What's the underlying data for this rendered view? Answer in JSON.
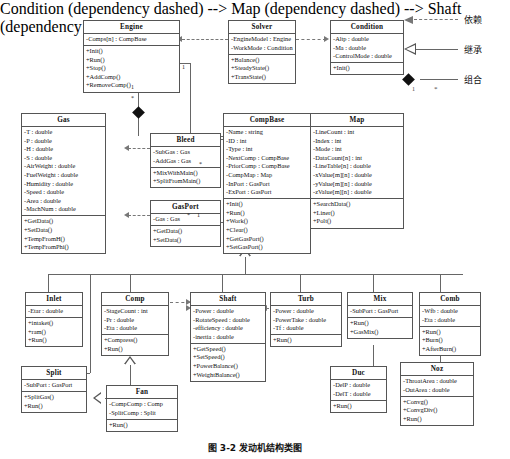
{
  "caption": "图 3-2  发动机结构类图",
  "legend": {
    "items": [
      {
        "name": "dependency",
        "label": "依赖",
        "marker": "dashed-open-arrow"
      },
      {
        "name": "inheritance",
        "label": "继承",
        "marker": "hollow-triangle"
      },
      {
        "name": "composition",
        "label": "组合",
        "marker": "filled-diamond",
        "mult_left": "1",
        "mult_right": "*"
      }
    ]
  },
  "classes": {
    "engine": {
      "title": "Engine",
      "attributes": [
        "-Comps[n] : CompBase"
      ],
      "methods": [
        "+Init()",
        "+Run()",
        "+Stop()",
        "+AddComp()",
        "+RemoveComp()"
      ]
    },
    "solver": {
      "title": "Solver",
      "attributes": [
        "-EngineModel : Engine",
        "-WorkMode : Condition"
      ],
      "methods": [
        "+Balance()",
        "+SteadyState()",
        "+TransState()"
      ]
    },
    "condition": {
      "title": "Condition",
      "attributes": [
        "-Altp : double",
        "-Ma : double",
        "-ControlMode : double"
      ],
      "methods": [
        "+Init()"
      ]
    },
    "gas": {
      "title": "Gas",
      "attributes": [
        "-T : double",
        "-P : double",
        "-H : double",
        "-S : double",
        "-AirWeight : double",
        "-FuelWeight : double",
        "-Humidity : double",
        "-Speed : double",
        "-Area : double",
        "-MachNum : double"
      ],
      "methods": [
        "+GetData()",
        "+SetData()",
        "+TempFromH()",
        "+TempFromPhi()"
      ]
    },
    "bleed": {
      "title": "Bleed",
      "attributes": [
        "-SubGas : Gas",
        "-AddGas : Gas"
      ],
      "methods": [
        "+MixWithMain()",
        "+SplitFromMain()"
      ]
    },
    "gasport": {
      "title": "GasPort",
      "attributes": [
        "-Gas : Gas"
      ],
      "methods": [
        "+GetData()",
        "+SetData()"
      ]
    },
    "compbase": {
      "title": "CompBase",
      "attributes": [
        "-Name : string",
        "-ID : int",
        "-Type : int",
        "-NextComp : CompBase",
        "-PriorComp : CompBase",
        "-CompMap : Map",
        "-InPort : GasPort",
        "-ExPort : GasPort"
      ],
      "methods": [
        "+Init()",
        "+Run()",
        "+Work()",
        "+Clear()",
        "+GetGasPort()",
        "+SetGasPort()"
      ]
    },
    "map": {
      "title": "Map",
      "attributes": [
        "-LineCount : int",
        "-Index : int",
        "-Mode : int",
        "-DataCount[n] : int",
        "-LineTable[n] : double",
        "-xValue[m][n] : double",
        "-yValue[m][n] : double",
        "-zValue[m][n] : double"
      ],
      "methods": [
        "+SearchData()",
        "+Liner()",
        "+Polt()"
      ]
    },
    "inlet": {
      "title": "Inlet",
      "attributes": [
        "-Etar : double"
      ],
      "methods": [
        "+intaket()",
        "+ram()",
        "+Run()"
      ]
    },
    "comp": {
      "title": "Comp",
      "attributes": [
        "-StageCount : int",
        "-Pr : double",
        "-Eta : double"
      ],
      "methods": [
        "+Compress()",
        "+Run()"
      ]
    },
    "shaft": {
      "title": "Shaft",
      "attributes": [
        "-Power : double",
        "-RotateSpeed : double",
        "-efficiency : double",
        "-inertia : double"
      ],
      "methods": [
        "+GetSpeed()",
        "+SetSpeed()",
        "+PowerBalance()",
        "+WeightBalance()"
      ]
    },
    "turb": {
      "title": "Turb",
      "attributes": [
        "-Power : double",
        "-PowerTake : double",
        "-Tf : double"
      ],
      "methods": [
        "+Run()"
      ]
    },
    "mix": {
      "title": "Mix",
      "attributes": [
        "-SubPort : GasPort"
      ],
      "methods": [
        "+Run()",
        "+GasMix()"
      ]
    },
    "comb": {
      "title": "Comb",
      "attributes": [
        "-Wfb : double",
        "-Eta : double"
      ],
      "methods": [
        "+Run()",
        "+Burn()",
        "+AfterBurn()"
      ]
    },
    "split": {
      "title": "Split",
      "attributes": [
        "-SubPort : GasPort"
      ],
      "methods": [
        "+SplitGas()",
        "+Run()"
      ]
    },
    "fan": {
      "title": "Fan",
      "attributes": [
        "-CompComp : Comp",
        "-SplitComp : Split"
      ],
      "methods": [
        "+Run()"
      ]
    },
    "duc": {
      "title": "Duc",
      "attributes": [
        "-DelP : double",
        "-DelT : double"
      ],
      "methods": [
        "+Run()"
      ]
    },
    "noz": {
      "title": "Noz",
      "attributes": [
        "-ThroatArea : double",
        "-OutArea : double"
      ],
      "methods": [
        "+Convg()",
        "+ConvgDiv()",
        "+Run()"
      ]
    }
  },
  "multiplicities": {
    "engine_compbase_1": "1",
    "engine_gas_1": "1",
    "engine_gas_star": "*",
    "compbase_gasport_star": "*",
    "compbase_gasport_1": "1",
    "compbase_bleed_star": "*"
  },
  "colors": {
    "line": "#666666",
    "box_border": "#555555",
    "background": "#ffffff",
    "text": "#111111"
  }
}
